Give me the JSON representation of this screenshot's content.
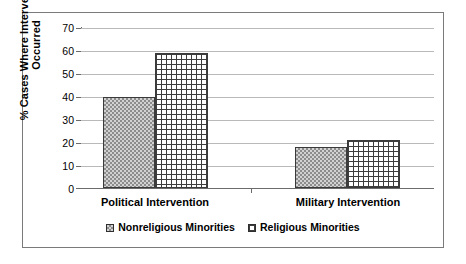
{
  "chart_data": {
    "type": "bar",
    "title": "",
    "xlabel": "",
    "ylabel": "% Cases Where Intervention Occurred",
    "categories": [
      "Political Intervention",
      "Military Intervention"
    ],
    "series": [
      {
        "name": "Nonreligious Minorities",
        "values": [
          40,
          18
        ],
        "pattern": "dots"
      },
      {
        "name": "Religious Minorities",
        "values": [
          59,
          21
        ],
        "pattern": "grid"
      }
    ],
    "ylim": [
      0,
      70
    ],
    "yticks": [
      0,
      10,
      20,
      30,
      40,
      50,
      60,
      70
    ],
    "ytick_labels": [
      "0",
      "10",
      "20",
      "30",
      "40",
      "50",
      "60",
      "70"
    ],
    "grid": true,
    "legend_position": "bottom",
    "colors": {
      "axis": "#6b6b6b",
      "gridline": "#b9b9b9",
      "bar_outline": "#3a3a3a",
      "dots_fill": "#d2d2d2",
      "grid_fill": "#ffffff",
      "frame": "#7a7a7a"
    }
  },
  "legend": {
    "items": [
      {
        "label": "Nonreligious Minorities",
        "swatch": "dots-swatch-icon"
      },
      {
        "label": "Religious Minorities",
        "swatch": "grid-swatch-icon"
      }
    ]
  }
}
